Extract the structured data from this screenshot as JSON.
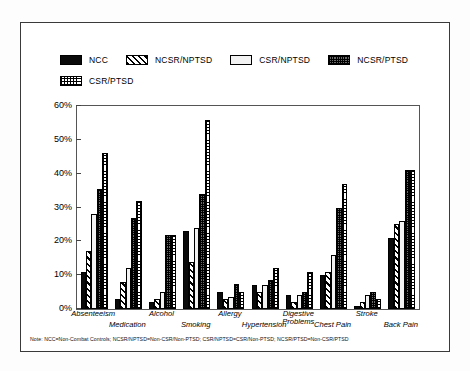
{
  "figure": {
    "footnote": "Note: NCC=Non-Combat Controls; NCSR/NPTSD=Non-CSR/Non-PTSD; CSR/NPTSD=CSR/Non-PTSD; NCSR/PTSD=Non-CSR/PTSD"
  },
  "chart_data": {
    "type": "bar",
    "title": "",
    "xlabel": "",
    "ylabel": "",
    "ylim": [
      0,
      60
    ],
    "ytick_labels": [
      "0%",
      "10%",
      "20%",
      "30%",
      "40%",
      "50%",
      "60%"
    ],
    "ytick_values": [
      0,
      10,
      20,
      30,
      40,
      50,
      60
    ],
    "grid": false,
    "legend_position": "top",
    "value_suffix": "%",
    "categories": [
      "Absenteeism",
      "Medication",
      "Alcohol",
      "Smoking",
      "Allergy",
      "Hypertension",
      "Digestive Problems",
      "Chest Pain",
      "Stroke",
      "Back Pain"
    ],
    "series": [
      {
        "name": "NCC",
        "pattern": "solid-black",
        "values": [
          11,
          3,
          2,
          23,
          5,
          7,
          4,
          10,
          1,
          21
        ]
      },
      {
        "name": "NCSR/NPTSD",
        "pattern": "diagonal-hatch",
        "values": [
          17,
          8,
          3,
          14,
          3,
          5,
          2,
          11,
          2,
          25
        ]
      },
      {
        "name": "CSR/NPTSD",
        "pattern": "light-fill",
        "values": [
          28,
          12,
          5,
          24,
          3.5,
          7,
          4,
          16,
          4,
          26
        ]
      },
      {
        "name": "NCSR/PTSD",
        "pattern": "dark-grid",
        "values": [
          35.5,
          27,
          22,
          34,
          7.5,
          8.5,
          5,
          30,
          5,
          41
        ]
      },
      {
        "name": "CSR/PTSD",
        "pattern": "fine-grid",
        "values": [
          46,
          32,
          22,
          56,
          5,
          12,
          11,
          37,
          3,
          41
        ]
      }
    ]
  }
}
